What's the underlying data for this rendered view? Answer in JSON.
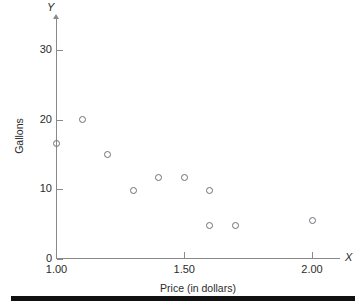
{
  "chart_data": {
    "type": "scatter",
    "title": "",
    "xlabel": "Price (in dollars)",
    "ylabel": "Gallons",
    "x_axis_name": "X",
    "y_axis_name": "Y",
    "xlim": [
      1.0,
      2.11
    ],
    "ylim": [
      0,
      35
    ],
    "grid": false,
    "legend": null,
    "x_ticks": [
      {
        "value": 1.0,
        "label": "1.00"
      },
      {
        "value": 1.5,
        "label": "1.50"
      },
      {
        "value": 2.0,
        "label": "2.00"
      }
    ],
    "y_ticks": [
      {
        "value": 0,
        "label": "0"
      },
      {
        "value": 10,
        "label": "10"
      },
      {
        "value": 20,
        "label": "20"
      },
      {
        "value": 30,
        "label": "30"
      }
    ],
    "marker": "open-circle",
    "marker_color": "#6e6e78",
    "points": [
      {
        "x": 1.0,
        "y": 16.5
      },
      {
        "x": 1.1,
        "y": 20.0
      },
      {
        "x": 1.2,
        "y": 15.0
      },
      {
        "x": 1.3,
        "y": 9.8
      },
      {
        "x": 1.4,
        "y": 11.6
      },
      {
        "x": 1.5,
        "y": 11.6
      },
      {
        "x": 1.6,
        "y": 9.8
      },
      {
        "x": 1.6,
        "y": 4.7
      },
      {
        "x": 1.7,
        "y": 4.7
      },
      {
        "x": 2.0,
        "y": 5.5
      }
    ]
  },
  "colors": {
    "axis": "#8a8a8a",
    "text": "#2b2b2b",
    "marker": "#6e6e78",
    "rule": "#111111",
    "background": "#ffffff"
  }
}
